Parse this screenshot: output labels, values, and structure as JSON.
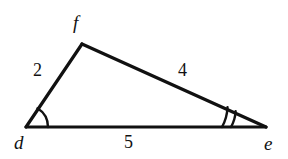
{
  "figure": {
    "type": "triangle-diagram",
    "background_color": "#ffffff",
    "stroke_color": "#111111",
    "vertices": {
      "d": {
        "label": "d",
        "x": 26,
        "y": 127
      },
      "f": {
        "label": "f",
        "x": 82,
        "y": 44
      },
      "e": {
        "label": "e",
        "x": 266,
        "y": 127
      }
    },
    "sides": [
      {
        "name": "df",
        "label": "2",
        "from": "d",
        "to": "f"
      },
      {
        "name": "fe",
        "label": "4",
        "from": "f",
        "to": "e"
      },
      {
        "name": "de",
        "label": "5",
        "from": "d",
        "to": "e"
      }
    ],
    "angle_marks": [
      {
        "at": "d",
        "arcs": 1,
        "name": "angle-arc-d"
      },
      {
        "at": "e",
        "arcs": 2,
        "name": "angle-arc-e"
      }
    ]
  }
}
